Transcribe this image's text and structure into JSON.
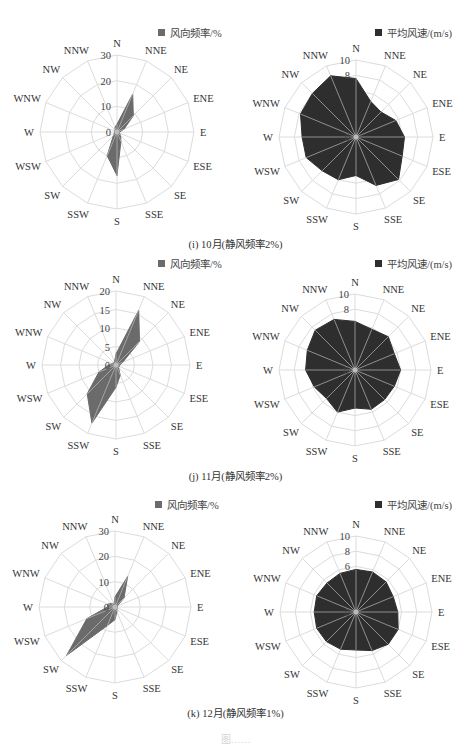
{
  "directions": [
    "N",
    "NNE",
    "NE",
    "ENE",
    "E",
    "ESE",
    "SE",
    "SSE",
    "S",
    "SSW",
    "SW",
    "WSW",
    "W",
    "WNW",
    "NW",
    "NNW"
  ],
  "legends": {
    "frequency": "风向频率/%",
    "speed": "平均风速/(m/s)"
  },
  "colors": {
    "frequency_fill": "#6b6b6b",
    "speed_fill": "#2e2e2e",
    "grid": "#dcdcdc",
    "spoke_overlay": "#c8c8c8",
    "label": "#333333"
  },
  "captions": [
    "(i) 10月(静风频率2%)",
    "(j) 11月(静风频率2%)",
    "(k) 12月(静风频率1%)"
  ],
  "figure_caption_partial": "图……",
  "chart_data": [
    {
      "type": "radar",
      "title": "风向频率/%",
      "month": "10月",
      "categories": [
        "N",
        "NNE",
        "NE",
        "ENE",
        "E",
        "ESE",
        "SE",
        "SSE",
        "S",
        "SSW",
        "SW",
        "WSW",
        "W",
        "WNW",
        "NW",
        "NNW"
      ],
      "values": [
        3,
        16,
        9,
        3,
        1,
        1,
        2,
        4,
        17,
        10,
        2,
        1,
        1,
        1,
        1,
        2
      ],
      "rlim": [
        0,
        30
      ],
      "ticks": [
        0,
        10,
        20,
        30
      ],
      "grid": true,
      "legend_position": "top-right"
    },
    {
      "type": "radar",
      "title": "平均风速/(m/s)",
      "month": "10月",
      "categories": [
        "N",
        "NNE",
        "NE",
        "ENE",
        "E",
        "ESE",
        "SE",
        "SSE",
        "S",
        "SSW",
        "SW",
        "WSW",
        "W",
        "WNW",
        "NW",
        "NNW"
      ],
      "values": [
        7.6,
        5.0,
        4.6,
        5.6,
        6.3,
        6.5,
        7.8,
        6.8,
        5.0,
        6.0,
        6.2,
        7.0,
        7.0,
        7.8,
        8.0,
        8.6
      ],
      "rlim": [
        0,
        10
      ],
      "ticks": [
        0,
        2,
        4,
        6,
        8,
        10
      ],
      "tick_labels_visible": [
        "0",
        "8",
        "10"
      ],
      "grid": true,
      "legend_position": "top-right"
    },
    {
      "type": "radar",
      "title": "风向频率/%",
      "month": "11月",
      "categories": [
        "N",
        "NNE",
        "NE",
        "ENE",
        "E",
        "ESE",
        "SE",
        "SSE",
        "S",
        "SSW",
        "SW",
        "WSW",
        "W",
        "WNW",
        "NW",
        "NNW"
      ],
      "values": [
        3,
        16,
        9,
        2,
        1,
        1,
        1,
        3,
        6,
        17,
        11,
        5,
        2,
        1,
        1,
        1
      ],
      "rlim": [
        0,
        20
      ],
      "ticks": [
        0,
        5,
        10,
        15,
        20
      ],
      "grid": true,
      "legend_position": "top-right"
    },
    {
      "type": "radar",
      "title": "平均风速/(m/s)",
      "month": "11月",
      "categories": [
        "N",
        "NNE",
        "NE",
        "ENE",
        "E",
        "ESE",
        "SE",
        "SSE",
        "S",
        "SSW",
        "SW",
        "WSW",
        "W",
        "WNW",
        "NW",
        "NNW"
      ],
      "values": [
        6.4,
        5.8,
        6.2,
        5.6,
        6.0,
        5.6,
        5.5,
        5.6,
        5.0,
        6.0,
        5.3,
        5.8,
        6.5,
        6.8,
        7.4,
        7.2
      ],
      "rlim": [
        0,
        10
      ],
      "ticks": [
        0,
        2,
        4,
        6,
        8,
        10
      ],
      "tick_labels_visible": [
        "0",
        "8",
        "10"
      ],
      "grid": true,
      "legend_position": "top-right"
    },
    {
      "type": "radar",
      "title": "风向频率/%",
      "month": "12月",
      "categories": [
        "N",
        "NNE",
        "NE",
        "ENE",
        "E",
        "ESE",
        "SE",
        "SSE",
        "S",
        "SSW",
        "SW",
        "WSW",
        "W",
        "WNW",
        "NW",
        "NNW"
      ],
      "values": [
        4,
        13,
        5,
        1,
        1,
        1,
        1,
        2,
        5,
        8,
        27,
        12,
        3,
        3,
        2,
        1
      ],
      "rlim": [
        0,
        30
      ],
      "ticks": [
        0,
        10,
        20,
        30
      ],
      "grid": true,
      "legend_position": "top-right"
    },
    {
      "type": "radar",
      "title": "平均风速/(m/s)",
      "month": "12月",
      "categories": [
        "N",
        "NNE",
        "NE",
        "ENE",
        "E",
        "ESE",
        "SE",
        "SSE",
        "S",
        "SSW",
        "SW",
        "WSW",
        "W",
        "WNW",
        "NW",
        "NNW"
      ],
      "values": [
        5.6,
        5.7,
        5.6,
        5.3,
        5.5,
        6.0,
        6.0,
        5.5,
        5.0,
        5.3,
        5.5,
        5.6,
        5.5,
        5.6,
        5.4,
        5.5
      ],
      "rlim": [
        0,
        10
      ],
      "ticks": [
        0,
        2,
        4,
        6,
        8,
        10
      ],
      "tick_labels_visible": [
        "0",
        "6",
        "8",
        "10"
      ],
      "grid": true,
      "legend_position": "top-right"
    }
  ],
  "layout": {
    "panels": [
      {
        "cx": 117,
        "cy": 132,
        "r": 77,
        "legend_x": 158,
        "legend_y": 25,
        "legend_kind": "frequency"
      },
      {
        "cx": 356,
        "cy": 137,
        "r": 77,
        "legend_x": 375,
        "legend_y": 25,
        "legend_kind": "speed"
      },
      {
        "cx": 116,
        "cy": 365,
        "r": 74,
        "legend_x": 158,
        "legend_y": 256,
        "legend_kind": "frequency"
      },
      {
        "cx": 355,
        "cy": 370,
        "r": 76,
        "legend_x": 375,
        "legend_y": 256,
        "legend_kind": "speed"
      },
      {
        "cx": 115,
        "cy": 607,
        "r": 76,
        "legend_x": 155,
        "legend_y": 497,
        "legend_kind": "frequency"
      },
      {
        "cx": 356,
        "cy": 612,
        "r": 76,
        "legend_x": 375,
        "legend_y": 497,
        "legend_kind": "speed"
      }
    ],
    "caption_tops": [
      236,
      468,
      705
    ]
  }
}
